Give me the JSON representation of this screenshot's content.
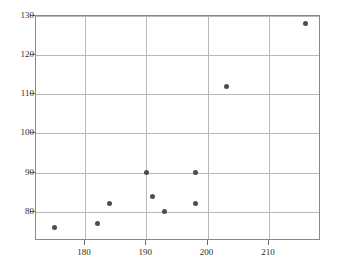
{
  "chart_data": {
    "type": "scatter",
    "title": "",
    "xlabel": "",
    "ylabel": "",
    "xlim": [
      172,
      218.5
    ],
    "ylim": [
      72.5,
      130
    ],
    "grid": true,
    "legend": null,
    "xticks": [
      180,
      190,
      200,
      210
    ],
    "yticks": [
      80,
      90,
      100,
      110,
      120,
      130
    ],
    "xtick_labels": [
      "180",
      "190",
      "200",
      "210"
    ],
    "ytick_labels": [
      "80",
      "90",
      "100",
      "110",
      "120",
      "130"
    ],
    "marker": {
      "shape": "circle",
      "color": "#4c4c52",
      "size": 5
    },
    "grid_color": "#b9b9b9",
    "frame_color": "#8a8a8a",
    "x": [
      175,
      182,
      184,
      190,
      191,
      193,
      198,
      198,
      203,
      216
    ],
    "y": [
      76,
      77,
      82,
      90,
      84,
      80,
      90,
      82,
      112,
      128
    ],
    "points": [
      {
        "x": 175,
        "y": 76
      },
      {
        "x": 182,
        "y": 77
      },
      {
        "x": 184,
        "y": 82
      },
      {
        "x": 190,
        "y": 90
      },
      {
        "x": 191,
        "y": 84
      },
      {
        "x": 193,
        "y": 80
      },
      {
        "x": 198,
        "y": 90
      },
      {
        "x": 198,
        "y": 82
      },
      {
        "x": 203,
        "y": 112
      },
      {
        "x": 216,
        "y": 128
      }
    ]
  }
}
